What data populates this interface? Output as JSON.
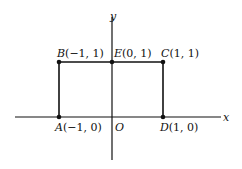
{
  "axes": {
    "x_label": "x",
    "y_label": "y",
    "origin_label": "O"
  },
  "points": [
    {
      "name": "A",
      "coords": "(−1, 0)",
      "x": -1,
      "y": 0
    },
    {
      "name": "B",
      "coords": "(−1, 1)",
      "x": -1,
      "y": 1
    },
    {
      "name": "C",
      "coords": "(1, 1)",
      "x": 1,
      "y": 1
    },
    {
      "name": "D",
      "coords": "(1, 0)",
      "x": 1,
      "y": 0
    },
    {
      "name": "E",
      "coords": "(0, 1)",
      "x": 0,
      "y": 1
    }
  ],
  "colors": {
    "line": "#111111",
    "background": "#ffffff"
  }
}
